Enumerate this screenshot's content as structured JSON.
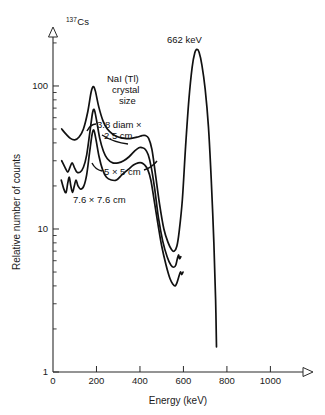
{
  "figure": {
    "nuclide_superscript": "137",
    "nuclide_symbol": "Cs",
    "peak_annotation": "662 keV",
    "crystal_note_line1": "NaI (Tl)",
    "crystal_note_line2": "crystal",
    "crystal_note_line3": "size",
    "line_color": "#111111",
    "axis_color": "#2b2b2b",
    "background": "#ffffff"
  },
  "chart_data": {
    "type": "line",
    "title": "137Cs",
    "xlabel": "Energy (keV)",
    "ylabel": "Relative number of counts",
    "xlim": [
      0,
      1150
    ],
    "ylim": [
      1,
      220
    ],
    "yscale": "log",
    "xscale": "linear",
    "grid": false,
    "legend": "inline-annotations",
    "xticks": [
      0,
      200,
      400,
      600,
      800,
      1000
    ],
    "xtick_labels": [
      "0",
      "200",
      "400",
      "600",
      "800",
      "1000"
    ],
    "yticks": [
      1,
      10,
      100
    ],
    "ytick_labels": [
      "1",
      "10",
      "100"
    ],
    "yminor_ticks": [
      2,
      3,
      4,
      5,
      6,
      7,
      8,
      9,
      20,
      30,
      40,
      50,
      60,
      70,
      80,
      90,
      200
    ],
    "annotations": [
      {
        "text": "662 keV",
        "x": 660,
        "y": 185,
        "note": "photopeak label"
      },
      {
        "text": "NaI (Tl)",
        "x": 360,
        "y": 125,
        "note": "crystal note"
      },
      {
        "text": "crystal",
        "x": 360,
        "y": 110,
        "note": "crystal note"
      },
      {
        "text": "size",
        "x": 360,
        "y": 97,
        "note": "crystal note"
      }
    ],
    "series": [
      {
        "name": "3.8 diam × 2.5 cm",
        "label": "3.8 diam ×",
        "label2": "2.5 cm",
        "points": [
          [
            40,
            50
          ],
          [
            60,
            46
          ],
          [
            80,
            43
          ],
          [
            100,
            42
          ],
          [
            120,
            44
          ],
          [
            140,
            50
          ],
          [
            160,
            66
          ],
          [
            175,
            90
          ],
          [
            185,
            99
          ],
          [
            195,
            92
          ],
          [
            210,
            72
          ],
          [
            230,
            57
          ],
          [
            250,
            50
          ],
          [
            275,
            46
          ],
          [
            300,
            44
          ],
          [
            330,
            43
          ],
          [
            360,
            43
          ],
          [
            390,
            44
          ],
          [
            410,
            45
          ],
          [
            425,
            45
          ],
          [
            440,
            43
          ],
          [
            455,
            36
          ],
          [
            470,
            25
          ],
          [
            490,
            15
          ],
          [
            510,
            10
          ],
          [
            530,
            8.0
          ],
          [
            545,
            7.2
          ],
          [
            558,
            7.0
          ],
          [
            570,
            7.6
          ],
          [
            580,
            9.5
          ],
          [
            595,
            16
          ],
          [
            610,
            38
          ],
          [
            625,
            80
          ],
          [
            640,
            135
          ],
          [
            652,
            170
          ],
          [
            662,
            180
          ],
          [
            672,
            172
          ],
          [
            685,
            140
          ],
          [
            700,
            95
          ],
          [
            715,
            52
          ],
          [
            728,
            22
          ],
          [
            740,
            8
          ],
          [
            748,
            3.2
          ],
          [
            752,
            1.5
          ]
        ]
      },
      {
        "name": "5 × 5 cm",
        "label": "5 × 5 cm",
        "points": [
          [
            40,
            30
          ],
          [
            55,
            27
          ],
          [
            68,
            25
          ],
          [
            78,
            27
          ],
          [
            88,
            29
          ],
          [
            98,
            27
          ],
          [
            110,
            25
          ],
          [
            125,
            25
          ],
          [
            140,
            27
          ],
          [
            155,
            33
          ],
          [
            170,
            48
          ],
          [
            182,
            65
          ],
          [
            190,
            68
          ],
          [
            200,
            58
          ],
          [
            215,
            43
          ],
          [
            232,
            35
          ],
          [
            250,
            31
          ],
          [
            275,
            29
          ],
          [
            300,
            29
          ],
          [
            325,
            30
          ],
          [
            350,
            32
          ],
          [
            375,
            35
          ],
          [
            395,
            37
          ],
          [
            410,
            37
          ],
          [
            425,
            36
          ],
          [
            438,
            33
          ],
          [
            452,
            27
          ],
          [
            468,
            19
          ],
          [
            485,
            12
          ],
          [
            505,
            8.2
          ],
          [
            525,
            6.4
          ],
          [
            542,
            5.6
          ],
          [
            556,
            5.4
          ],
          [
            565,
            5.6
          ],
          [
            572,
            6.2
          ],
          [
            578,
            6.6
          ],
          [
            582,
            6.2
          ],
          [
            588,
            6.4
          ]
        ]
      },
      {
        "name": "7.6 × 7.6 cm",
        "label": "7.6 × 7.6 cm",
        "points": [
          [
            38,
            22
          ],
          [
            50,
            19
          ],
          [
            60,
            18
          ],
          [
            68,
            21
          ],
          [
            75,
            23
          ],
          [
            82,
            20
          ],
          [
            90,
            18
          ],
          [
            98,
            20
          ],
          [
            106,
            22
          ],
          [
            115,
            20
          ],
          [
            128,
            19
          ],
          [
            142,
            20
          ],
          [
            155,
            24
          ],
          [
            168,
            34
          ],
          [
            180,
            46
          ],
          [
            188,
            49
          ],
          [
            198,
            42
          ],
          [
            212,
            32
          ],
          [
            228,
            26
          ],
          [
            246,
            23
          ],
          [
            268,
            22
          ],
          [
            292,
            22
          ],
          [
            318,
            24
          ],
          [
            345,
            26
          ],
          [
            370,
            28
          ],
          [
            392,
            29
          ],
          [
            408,
            29
          ],
          [
            422,
            28
          ],
          [
            436,
            26
          ],
          [
            450,
            22
          ],
          [
            465,
            16
          ],
          [
            482,
            11
          ],
          [
            500,
            7.6
          ],
          [
            520,
            5.6
          ],
          [
            538,
            4.5
          ],
          [
            552,
            4.1
          ],
          [
            562,
            4.0
          ],
          [
            570,
            4.2
          ],
          [
            578,
            4.6
          ],
          [
            586,
            5.0
          ],
          [
            592,
            4.8
          ],
          [
            598,
            5.0
          ]
        ]
      }
    ]
  },
  "series_labels": {
    "s1_line1": "3.8 diam ×",
    "s1_line2": "2.5 cm",
    "s2": "5 × 5 cm",
    "s3": "7.6 × 7.6 cm"
  },
  "axes": {
    "x_title": "Energy (keV)",
    "y_title": "Relative number of counts",
    "x_tick_labels": [
      "0",
      "200",
      "400",
      "600",
      "800",
      "1000"
    ],
    "y_tick_labels": [
      "100",
      "10",
      "1"
    ]
  }
}
